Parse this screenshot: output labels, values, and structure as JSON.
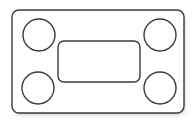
{
  "canvas": {
    "width": 195,
    "height": 125,
    "background_color": "#ffffff",
    "title": "Mounting Plate Outline"
  },
  "style": {
    "stroke_color": "#3a3a3a",
    "stroke_width": 1.4,
    "fill_color": "none",
    "shadow_color": "#cfcfcf",
    "shadow_opacity": 0.55
  },
  "drawing": {
    "type": "technical-line-drawing",
    "description": "Rectangular plate with rounded corners, four circular corner holes and one central rounded rectangular cutout",
    "outer_plate": {
      "name": "outer-plate",
      "shape": "rounded-rectangle",
      "x": 12,
      "y": 10,
      "width": 172,
      "height": 103,
      "corner_radius": 7
    },
    "center_cutout": {
      "name": "center-cutout",
      "shape": "rounded-rectangle",
      "x": 58,
      "y": 41,
      "width": 82,
      "height": 41,
      "corner_radius": 6
    },
    "holes": [
      {
        "name": "hole-top-left",
        "cx": 39,
        "cy": 35,
        "r": 16
      },
      {
        "name": "hole-top-right",
        "cx": 160,
        "cy": 35,
        "r": 16
      },
      {
        "name": "hole-bottom-left",
        "cx": 38,
        "cy": 88,
        "r": 16
      },
      {
        "name": "hole-bottom-right",
        "cx": 160,
        "cy": 88,
        "r": 16
      }
    ],
    "hole_count": 4
  }
}
